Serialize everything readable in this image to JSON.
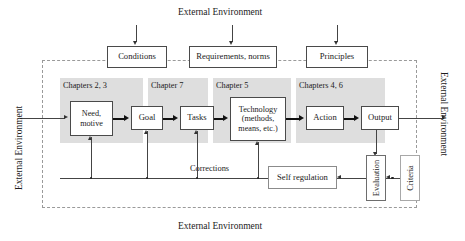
{
  "diagram": {
    "title_top": "External Environment",
    "title_bottom": "External Environment",
    "label_left": "External Environment",
    "label_right": "External Environment"
  },
  "top_row": {
    "conditions": "Conditions",
    "requirements": "Requirements, norms",
    "principles": "Principles"
  },
  "chapter_panels": [
    {
      "label": "Chapters 2, 3"
    },
    {
      "label": "Chapter 7"
    },
    {
      "label": "Chapter 5"
    },
    {
      "label": "Chapters 4, 6"
    }
  ],
  "process": {
    "need": "Need,\nmotive",
    "need_line1": "Need,",
    "need_line2": "motive",
    "goal": "Goal",
    "tasks": "Tasks",
    "technology_line1": "Technology",
    "technology_line2": "(methods,",
    "technology_line3": "means, etc.)",
    "action": "Action",
    "output": "Output"
  },
  "feedback": {
    "corrections": "Corrections",
    "self_regulation": "Self regulation",
    "evaluation": "Evaluation",
    "criteria": "Criteria"
  },
  "colors": {
    "panel_grey": "#dedede",
    "boundary_dash": "#9a9a9a",
    "box_border": "#4a4a4a",
    "line": "#333333",
    "text": "#1b1b1b"
  }
}
